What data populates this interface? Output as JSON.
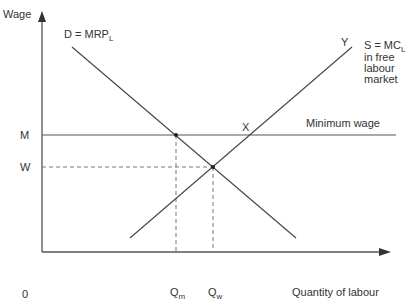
{
  "diagram": {
    "axes": {
      "y_label": "Wage",
      "x_label": "Quantity of labour",
      "origin": "0"
    },
    "curves": {
      "demand": {
        "label_main": "D = MRP",
        "label_sub": "L"
      },
      "supply": {
        "label_main": "S = MC",
        "label_sub": "L",
        "line2": "in free",
        "line3": "labour",
        "line4": "market"
      },
      "min_wage": {
        "label": "Minimum wage"
      }
    },
    "levels": {
      "m": "M",
      "w": "W"
    },
    "quantities": {
      "qm_main": "Q",
      "qm_sub": "m",
      "qw_main": "Q",
      "qw_sub": "w"
    },
    "points": {
      "x": "X",
      "y": "Y"
    },
    "colors": {
      "line": "#444444",
      "axis": "#555555",
      "dashed": "#777777"
    }
  }
}
